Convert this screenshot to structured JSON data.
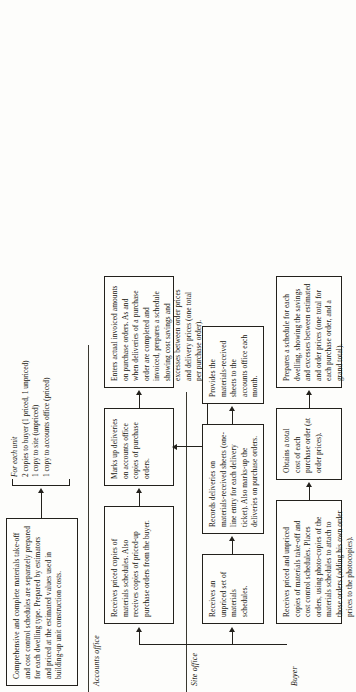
{
  "diagram": {
    "intro_box": "Comprehensive and complete materials take-off and cost control schedules are separately prepared for each dwelling type. Prepared by estimators and priced at the estimated values used in building-up unit construction costs.",
    "distribution_note": {
      "heading": "For each unit",
      "lines": [
        "2 copies to buyer (1 priced, 1 unpriced)",
        "1 copy to site (unpriced)",
        "1 copy to accounts office (priced)"
      ]
    },
    "lanes": [
      {
        "id": "accounts-office",
        "label": "Accounts office",
        "steps": [
          "Receives priced copies of materials schedules. Also receives copies of priced-up purchase orders from the buyer.",
          "Marks up deliveries on accounts office copies of purchase orders.",
          "Enters actual invoiced amounts on purchase orders. As and when deliveries of a purchase order are completed and invoiced, prepares a schedule showing cost savings and excesses between order prices and delivery prices (one total per purchase order)."
        ]
      },
      {
        "id": "site-office",
        "label": "Site office",
        "steps": [
          "Receives an unpriced set of materials schedules.",
          "Records deliveries on materials-received sheets (one-line entry for each delivery ticket). Also marks-up the deliveries on purchase orders.",
          "Provides the materials-received sheets to the accounts office each month."
        ]
      },
      {
        "id": "buyer",
        "label": "Buyer",
        "steps": [
          "Receives priced and unpriced copies of materials take-off and cost control schedules. Places orders, using photo-copies of the materials schedules to attach to those orders (adding his own order prices to the photocopies).",
          "Obtains a total cost of each purchase order (at order prices).",
          "Prepares a schedule for each dwelling, showing the savings and excesses between estimated and order prices (one total for each purchase order, and a grand total)."
        ]
      }
    ],
    "colors": {
      "ink": "#17150f",
      "rule": "#23211c",
      "paper": "#fdfdfb"
    }
  }
}
